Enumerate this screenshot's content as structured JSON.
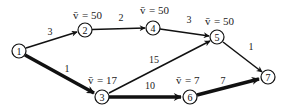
{
  "diagram": {
    "type": "directed-network-shortest-path",
    "nodes": [
      {
        "id": "1",
        "label": "1",
        "x": 19,
        "y": 51,
        "value_label": ""
      },
      {
        "id": "2",
        "label": "2",
        "x": 85,
        "y": 30,
        "value_label": "v = 50"
      },
      {
        "id": "3",
        "label": "3",
        "x": 102,
        "y": 97,
        "value_label": "v = 17"
      },
      {
        "id": "4",
        "label": "4",
        "x": 153,
        "y": 28,
        "value_label": "v = 50"
      },
      {
        "id": "5",
        "label": "5",
        "x": 217,
        "y": 37,
        "value_label": "v = 50"
      },
      {
        "id": "6",
        "label": "6",
        "x": 190,
        "y": 97,
        "value_label": "v = 7"
      },
      {
        "id": "7",
        "label": "7",
        "x": 268,
        "y": 77,
        "value_label": ""
      }
    ],
    "edges": [
      {
        "from": "1",
        "to": "2",
        "weight": "3",
        "bold": false
      },
      {
        "from": "1",
        "to": "3",
        "weight": "1",
        "bold": true
      },
      {
        "from": "2",
        "to": "4",
        "weight": "2",
        "bold": false
      },
      {
        "from": "4",
        "to": "5",
        "weight": "3",
        "bold": false
      },
      {
        "from": "3",
        "to": "5",
        "weight": "15",
        "bold": false
      },
      {
        "from": "3",
        "to": "6",
        "weight": "10",
        "bold": true
      },
      {
        "from": "5",
        "to": "7",
        "weight": "1",
        "bold": false
      },
      {
        "from": "6",
        "to": "7",
        "weight": "7",
        "bold": true
      }
    ],
    "value_symbol": "v̄",
    "value_labels": {
      "n2": "= 50",
      "n3": "= 17",
      "n4": "= 50",
      "n5": "= 50",
      "n6": "= 7"
    },
    "node_labels": {
      "n1": "1",
      "n2": "2",
      "n3": "3",
      "n4": "4",
      "n5": "5",
      "n6": "6",
      "n7": "7"
    },
    "edge_labels": {
      "e12": "3",
      "e13": "1",
      "e24": "2",
      "e45": "3",
      "e35": "15",
      "e36": "10",
      "e57": "1",
      "e67": "7"
    }
  }
}
